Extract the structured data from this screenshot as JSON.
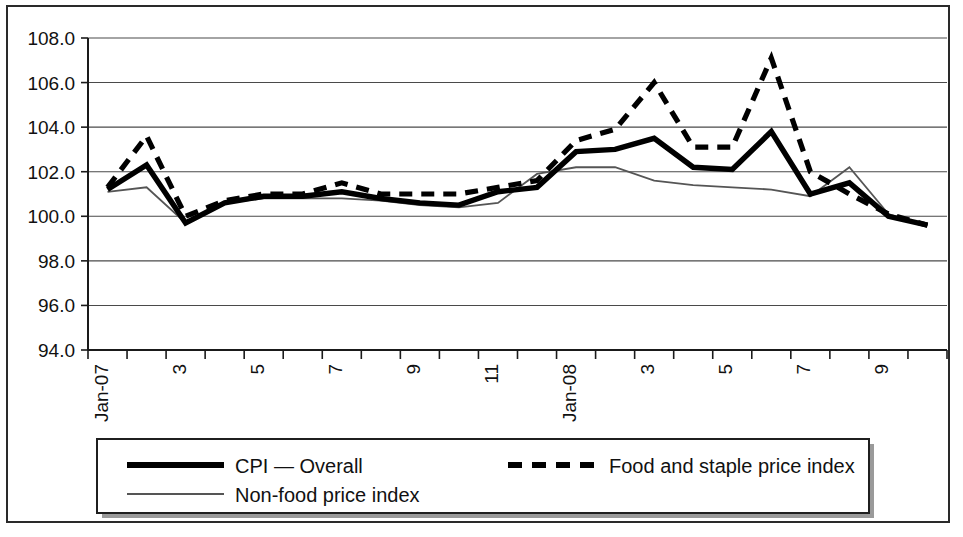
{
  "chart_data": {
    "type": "line",
    "title": "",
    "subtitle": "",
    "xlabel": "",
    "ylabel": "",
    "ylim": [
      94.0,
      108.0
    ],
    "ytick_step": 2.0,
    "ytick_labels": [
      "108.0",
      "106.0",
      "104.0",
      "102.0",
      "100.0",
      "98.0",
      "96.0",
      "94.0"
    ],
    "ytick_values": [
      108.0,
      106.0,
      104.0,
      102.0,
      100.0,
      98.0,
      96.0,
      94.0
    ],
    "grid": true,
    "grid_axis": "y",
    "legend_position": "bottom",
    "x": [
      "Jan-07",
      "2",
      "3",
      "4",
      "5",
      "6",
      "7",
      "8",
      "9",
      "10",
      "11",
      "12",
      "Jan-08",
      "2",
      "3",
      "4",
      "5",
      "6",
      "7",
      "8",
      "9",
      "10"
    ],
    "xtick_labels_visible": [
      "Jan-07",
      "",
      "3",
      "",
      "5",
      "",
      "7",
      "",
      "9",
      "",
      "11",
      "",
      "Jan-08",
      "",
      "3",
      "",
      "5",
      "",
      "7",
      "",
      "9",
      ""
    ],
    "xtick_rotation": 90,
    "series": [
      {
        "name": "CPI — Overall",
        "style": "thick-solid",
        "color": "#000000",
        "values": [
          101.2,
          102.3,
          99.7,
          100.6,
          100.9,
          100.9,
          101.1,
          100.8,
          100.6,
          100.5,
          101.1,
          101.3,
          102.9,
          103.0,
          103.5,
          102.2,
          102.1,
          103.8,
          101.0,
          101.5,
          100.0,
          99.6
        ]
      },
      {
        "name": "Food and staple price index",
        "style": "thick-dashed",
        "color": "#000000",
        "values": [
          101.3,
          103.6,
          100.0,
          100.7,
          101.0,
          101.0,
          101.5,
          101.0,
          101.0,
          101.0,
          101.3,
          101.6,
          103.4,
          103.9,
          106.0,
          103.1,
          103.1,
          107.1,
          102.0,
          101.0,
          100.1,
          99.6
        ]
      },
      {
        "name": "Non-food price index",
        "style": "thin-solid",
        "color": "#555555",
        "values": [
          101.1,
          101.3,
          99.7,
          100.6,
          100.8,
          100.8,
          100.8,
          100.7,
          100.5,
          100.4,
          100.6,
          101.9,
          102.2,
          102.2,
          101.6,
          101.4,
          101.3,
          101.2,
          100.9,
          102.2,
          100.1,
          99.6
        ]
      }
    ]
  },
  "legend": {
    "items": [
      {
        "label": "CPI — Overall",
        "style": "thick-solid"
      },
      {
        "label": "Food and staple price index",
        "style": "thick-dashed"
      },
      {
        "label": "Non-food price index",
        "style": "thin-solid"
      }
    ]
  }
}
